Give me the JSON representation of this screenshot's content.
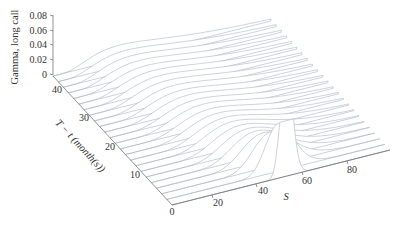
{
  "chart_data": {
    "type": "surface",
    "title": "",
    "zlabel": "Gamma, long call",
    "ylabel": "T − t (month(s))",
    "xlabel": "S",
    "z_ticks": [
      "0",
      "0.02",
      "0.04",
      "0.06",
      "0.08"
    ],
    "t_ticks": [
      "0",
      "10",
      "20",
      "30",
      "40"
    ],
    "s_ticks": [
      "20",
      "40",
      "60",
      "80"
    ],
    "zlim": [
      0,
      0.08
    ],
    "tlim": [
      0,
      48
    ],
    "slim": [
      0,
      95
    ],
    "strike": 50,
    "num_slices": 24,
    "peak_value_near_expiry": 0.058,
    "max_value_at_T48": 0.03,
    "grid": false,
    "line_color": "#a9b3c2"
  }
}
